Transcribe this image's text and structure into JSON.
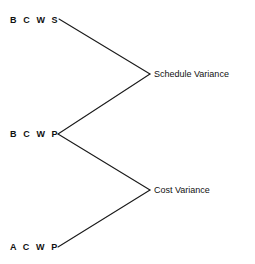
{
  "diagram": {
    "type": "convergence-diagram",
    "background_color": "#ffffff",
    "line_color": "#1a1a1a",
    "text_color": "#111111",
    "nodes": {
      "bcws": {
        "label": "B C W S",
        "x": 10,
        "y": 20
      },
      "bcwp": {
        "label": "B C W P",
        "x": 10,
        "y": 134
      },
      "acwp": {
        "label": "A C W P",
        "x": 10,
        "y": 247
      },
      "schedule_variance": {
        "label": "Schedule Variance",
        "x": 154,
        "y": 74
      },
      "cost_variance": {
        "label": "Cost Variance",
        "x": 154,
        "y": 190
      }
    },
    "edges": [
      {
        "name": "bcws-to-schedule-variance",
        "x1": 59,
        "y1": 19,
        "x2": 150,
        "y2": 74
      },
      {
        "name": "bcwp-to-schedule-variance",
        "x1": 58,
        "y1": 134,
        "x2": 150,
        "y2": 74
      },
      {
        "name": "bcwp-to-cost-variance",
        "x1": 58,
        "y1": 134,
        "x2": 150,
        "y2": 190
      },
      {
        "name": "acwp-to-cost-variance",
        "x1": 58,
        "y1": 247,
        "x2": 150,
        "y2": 190
      }
    ]
  }
}
